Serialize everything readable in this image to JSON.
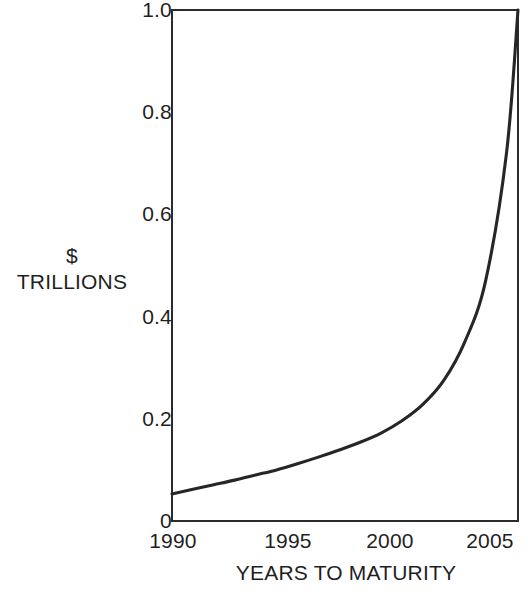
{
  "chart_data": {
    "type": "line",
    "title": "",
    "xlabel": "YEARS TO MATURITY",
    "ylabel": "$ TRILLIONS",
    "ylabel_lines": [
      "$",
      "TRILLIONS"
    ],
    "xlim": [
      1990,
      2006.55
    ],
    "ylim": [
      0,
      1.0
    ],
    "grid": false,
    "legend": null,
    "xticks": [
      1990,
      1995,
      2000,
      2005
    ],
    "xtick_labels": [
      "1990",
      "1995",
      "2000",
      "2005"
    ],
    "yticks": [
      0,
      0.2,
      0.4,
      0.6,
      0.8,
      1.0
    ],
    "ytick_labels": [
      "0",
      "0.2",
      "0.4",
      "0.6",
      "0.8",
      "1.0"
    ],
    "series": [
      {
        "name": "Maturing debt",
        "color": "#262626",
        "x": [
          1990,
          1991,
          1992,
          1993,
          1994,
          1995,
          1996,
          1997,
          1998,
          1999,
          2000,
          2001,
          2002,
          2003,
          2004,
          2005,
          2006,
          2006.55
        ],
        "values": [
          0.053,
          0.062,
          0.071,
          0.08,
          0.09,
          0.1,
          0.112,
          0.125,
          0.139,
          0.154,
          0.172,
          0.196,
          0.228,
          0.275,
          0.35,
          0.47,
          0.72,
          1.0
        ]
      }
    ],
    "annotations": []
  },
  "axes": {
    "y_axis_name": "dollars-trillions-axis",
    "x_axis_name": "years-to-maturity-axis"
  }
}
